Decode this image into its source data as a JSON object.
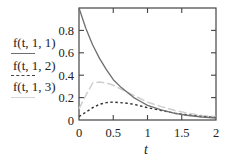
{
  "chart_data": {
    "type": "line",
    "title": "",
    "xlabel": "t",
    "ylabel": "",
    "xlim": [
      0,
      2
    ],
    "ylim": [
      0,
      1
    ],
    "grid": false,
    "legend_position": "left",
    "x_ticks": [
      0,
      0.5,
      1,
      1.5,
      2
    ],
    "x_tick_labels": [
      "0",
      "0.5",
      "1",
      "1.5",
      "2"
    ],
    "y_ticks": [
      0,
      0.2,
      0.4,
      0.6,
      0.8
    ],
    "y_tick_labels": [
      "0",
      "0.2",
      "0.4",
      "0.6",
      "0.8"
    ],
    "x": [
      0,
      0.1,
      0.2,
      0.3,
      0.4,
      0.5,
      0.6,
      0.7,
      0.8,
      0.9,
      1.0,
      1.2,
      1.4,
      1.6,
      1.8,
      2.0
    ],
    "series": [
      {
        "name": "f(t,1,1)",
        "style": "solid",
        "color": "#6e6e6e",
        "values": [
          1.0,
          0.82,
          0.67,
          0.55,
          0.45,
          0.36,
          0.3,
          0.25,
          0.2,
          0.165,
          0.13,
          0.09,
          0.06,
          0.04,
          0.027,
          0.018
        ]
      },
      {
        "name": "f(t,1,2)",
        "style": "dotted",
        "color": "#333333",
        "values": [
          0.03,
          0.07,
          0.11,
          0.14,
          0.155,
          0.16,
          0.155,
          0.15,
          0.14,
          0.125,
          0.11,
          0.085,
          0.06,
          0.045,
          0.03,
          0.022
        ]
      },
      {
        "name": "f(t,1,3)",
        "style": "dashed",
        "color": "#cfcfcf",
        "values": [
          0.1,
          0.22,
          0.33,
          0.34,
          0.33,
          0.31,
          0.28,
          0.25,
          0.22,
          0.19,
          0.16,
          0.12,
          0.085,
          0.06,
          0.04,
          0.03
        ]
      }
    ]
  },
  "legend": {
    "items": [
      {
        "label": "f(t, 1, 1)",
        "style": "solid",
        "color": "#6e6e6e"
      },
      {
        "label": "f(t, 1, 2)",
        "style": "dotted",
        "color": "#333333"
      },
      {
        "label": "f(t, 1, 3)",
        "style": "dashed",
        "color": "#cfcfcf"
      }
    ]
  },
  "axes": {
    "x_title": "t",
    "x_tick_labels": [
      "0",
      "0.5",
      "1",
      "1.5",
      "2"
    ],
    "y_tick_labels": [
      "0",
      "0.2",
      "0.4",
      "0.6",
      "0.8"
    ]
  }
}
